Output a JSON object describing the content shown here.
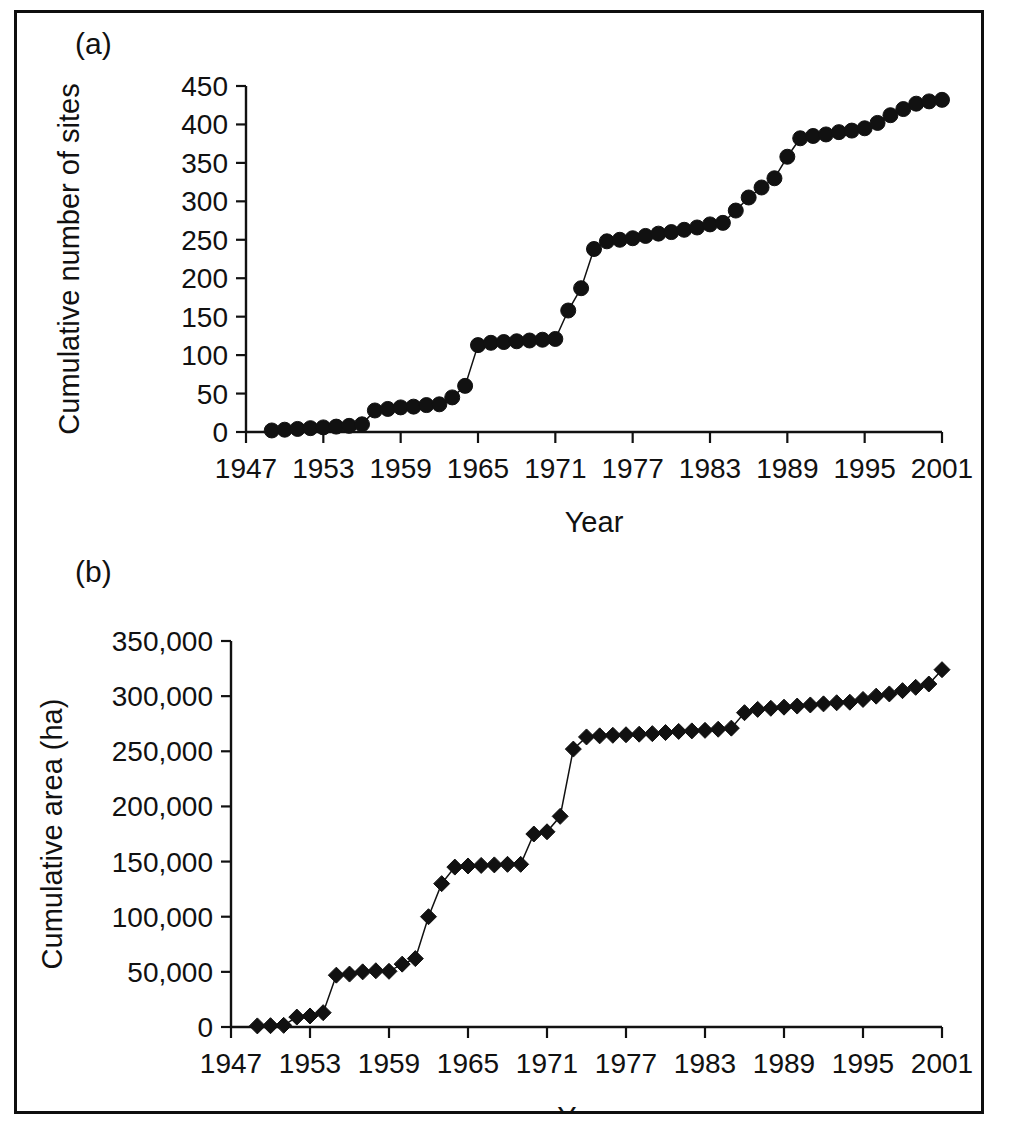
{
  "figure": {
    "background": "#ffffff",
    "border_color": "#0f0f0f",
    "marker_color": "#111111"
  },
  "panels": [
    {
      "tag": "(a)",
      "name": "panel-a"
    },
    {
      "tag": "(b)",
      "name": "panel-b"
    }
  ],
  "chart_data": [
    {
      "type": "line",
      "panel": "(a)",
      "title": "",
      "xlabel": "Year",
      "ylabel": "Cumulative number of sites",
      "xlim": [
        1947,
        2001
      ],
      "ylim": [
        0,
        450
      ],
      "xticks": [
        1947,
        1953,
        1959,
        1965,
        1971,
        1977,
        1983,
        1989,
        1995,
        2001
      ],
      "xtick_labels": [
        "1947",
        "1953",
        "1959",
        "1965",
        "1971",
        "1977",
        "1983",
        "1989",
        "1995",
        "2001"
      ],
      "yticks": [
        0,
        50,
        100,
        150,
        200,
        250,
        300,
        350,
        400,
        450
      ],
      "ytick_labels": [
        "0",
        "50",
        "100",
        "150",
        "200",
        "250",
        "300",
        "350",
        "400",
        "450"
      ],
      "grid": false,
      "legend": false,
      "marker": "circle",
      "x": [
        1949,
        1950,
        1951,
        1952,
        1953,
        1954,
        1955,
        1956,
        1957,
        1958,
        1959,
        1960,
        1961,
        1962,
        1963,
        1964,
        1965,
        1966,
        1967,
        1968,
        1969,
        1970,
        1971,
        1972,
        1973,
        1974,
        1975,
        1976,
        1977,
        1978,
        1979,
        1980,
        1981,
        1982,
        1983,
        1984,
        1985,
        1986,
        1987,
        1988,
        1989,
        1990,
        1991,
        1992,
        1993,
        1994,
        1995,
        1996,
        1997,
        1998,
        1999,
        2000,
        2001
      ],
      "y": [
        2,
        3,
        4,
        5,
        6,
        7,
        8,
        10,
        28,
        30,
        32,
        33,
        35,
        36,
        45,
        60,
        113,
        116,
        117,
        118,
        119,
        120,
        121,
        158,
        187,
        238,
        248,
        250,
        252,
        255,
        258,
        260,
        263,
        266,
        270,
        272,
        288,
        305,
        318,
        330,
        358,
        382,
        385,
        387,
        390,
        392,
        395,
        402,
        412,
        420,
        427,
        430,
        432
      ]
    },
    {
      "type": "line",
      "panel": "(b)",
      "title": "",
      "xlabel": "Year",
      "ylabel": "Cumulative area (ha)",
      "xlim": [
        1947,
        2001
      ],
      "ylim": [
        0,
        350000
      ],
      "xticks": [
        1947,
        1953,
        1959,
        1965,
        1971,
        1977,
        1983,
        1989,
        1995,
        2001
      ],
      "xtick_labels": [
        "1947",
        "1953",
        "1959",
        "1965",
        "1971",
        "1977",
        "1983",
        "1989",
        "1995",
        "2001"
      ],
      "yticks": [
        0,
        50000,
        100000,
        150000,
        200000,
        250000,
        300000,
        350000
      ],
      "ytick_labels": [
        "0",
        "50,000",
        "100,000",
        "150,000",
        "200,000",
        "250,000",
        "300,000",
        "350,000"
      ],
      "grid": false,
      "legend": false,
      "marker": "diamond",
      "x": [
        1949,
        1950,
        1951,
        1952,
        1953,
        1954,
        1955,
        1956,
        1957,
        1958,
        1959,
        1960,
        1961,
        1962,
        1963,
        1964,
        1965,
        1966,
        1967,
        1968,
        1969,
        1970,
        1971,
        1972,
        1973,
        1974,
        1975,
        1976,
        1977,
        1978,
        1979,
        1980,
        1981,
        1982,
        1983,
        1984,
        1985,
        1986,
        1987,
        1988,
        1989,
        1990,
        1991,
        1992,
        1993,
        1994,
        1995,
        1996,
        1997,
        1998,
        1999,
        2000,
        2001
      ],
      "y": [
        1000,
        1200,
        1500,
        9000,
        10000,
        13000,
        47000,
        48000,
        50000,
        51000,
        50500,
        57000,
        62000,
        100000,
        130000,
        145000,
        146000,
        146500,
        147000,
        147500,
        147500,
        175000,
        177000,
        191000,
        252000,
        263000,
        264000,
        264500,
        265000,
        265500,
        266000,
        267000,
        268000,
        268500,
        269000,
        270000,
        271000,
        285000,
        288000,
        289000,
        290000,
        291000,
        292000,
        293000,
        294000,
        294500,
        297000,
        300000,
        302000,
        305000,
        308000,
        311000,
        324000
      ]
    }
  ]
}
